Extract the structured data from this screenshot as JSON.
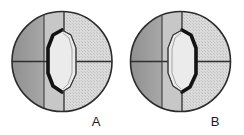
{
  "figure": {
    "background_color": "#ffffff",
    "outline_color": "#2b2b2b",
    "panels": [
      {
        "id": "panel-a",
        "label": "A",
        "label_position": {
          "x": 96,
          "y": 126
        },
        "circle": {
          "cx": 62,
          "cy": 61.5,
          "r": 50
        },
        "crosshair": {
          "horizontal_line_y": 61.5,
          "vertical_lines_x": [
            44,
            64
          ]
        },
        "regions": [
          {
            "name": "left-outer-zone",
            "fill": "#9a9a9a",
            "pattern": "solid-gray"
          },
          {
            "name": "middle-zone",
            "fill": "#c2c2c2",
            "pattern": "light-gray"
          },
          {
            "name": "right-outer-zone",
            "fill": "#d5d5d5",
            "pattern": "stipple"
          }
        ],
        "lens": {
          "name": "central-lens",
          "cx": 62,
          "cy": 61,
          "half_width": 14,
          "half_height": 31,
          "fill": "#e8e8e8",
          "thick_edge_side": "left",
          "thick_edge_color": "#141414",
          "thin_edge_color": "#3a3a3a"
        }
      },
      {
        "id": "panel-b",
        "label": "B",
        "label_position": {
          "x": 215,
          "y": 126
        },
        "circle": {
          "cx": 180.5,
          "cy": 61.5,
          "r": 50
        },
        "crosshair": {
          "horizontal_line_y": 61.5,
          "vertical_lines_x": [
            162,
            182
          ]
        },
        "regions": [
          {
            "name": "left-outer-zone",
            "fill": "#9a9a9a",
            "pattern": "solid-gray"
          },
          {
            "name": "middle-zone",
            "fill": "#c2c2c2",
            "pattern": "light-gray"
          },
          {
            "name": "right-outer-zone",
            "fill": "#d5d5d5",
            "pattern": "stipple"
          }
        ],
        "lens": {
          "name": "central-lens",
          "cx": 182,
          "cy": 61,
          "half_width": 14,
          "half_height": 31,
          "fill": "#e8e8e8",
          "thick_edge_side": "right",
          "thick_edge_color": "#141414",
          "thin_edge_color": "#3a3a3a"
        }
      }
    ]
  }
}
